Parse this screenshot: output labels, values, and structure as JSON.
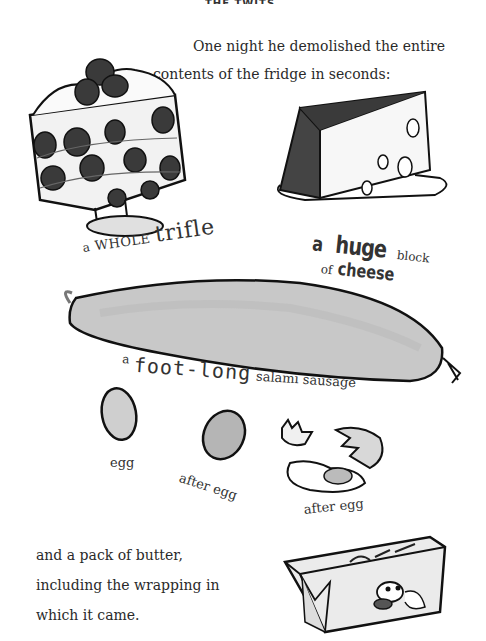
{
  "page": {
    "header_cropped": "THE TWITS CHAPTER",
    "intro_lines": [
      "One night he demolished the entire",
      "contents of the fridge in seconds:"
    ],
    "items": {
      "trifle": {
        "part1": "a",
        "part2": "WHOLE",
        "part3": "trifle"
      },
      "cheese": {
        "part1": "a",
        "part2": "huge",
        "part3": "block",
        "part4": "of",
        "part5": "cheese"
      },
      "salami": {
        "part1": "a",
        "part2": "foot-long",
        "part3": "salami sausage"
      },
      "eggs": [
        "egg",
        "after egg",
        "after egg"
      ]
    },
    "closing_lines": [
      "and a pack of butter,",
      "including the wrapping in",
      "which it came."
    ],
    "illustrations": [
      "trifle-illustration",
      "cheese-illustration",
      "salami-illustration",
      "egg-illustration",
      "egg-illustration",
      "broken-egg-illustration",
      "butter-pack-illustration"
    ]
  }
}
